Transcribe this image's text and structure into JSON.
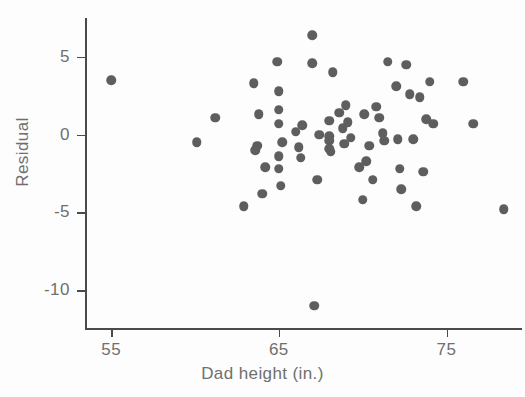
{
  "chart_data": {
    "type": "scatter",
    "title": "",
    "xlabel": "Dad height (in.)",
    "ylabel": "Residual",
    "xlim": [
      53.5,
      79.5
    ],
    "ylim": [
      -12.5,
      7.5
    ],
    "xticks": [
      55,
      65,
      75
    ],
    "xtick_labels": [
      "55",
      "65",
      "75"
    ],
    "yticks": [
      5,
      0,
      -5,
      -10
    ],
    "ytick_labels": [
      "5",
      "0",
      "-5",
      "-10"
    ],
    "grid": false,
    "legend": null,
    "marker": {
      "shape": "circle",
      "color": "#5e5e5e",
      "size": 9.5
    },
    "x": [
      55.0,
      61.2,
      60.1,
      62.9,
      63.6,
      63.7,
      63.8,
      63.5,
      64.0,
      64.2,
      64.9,
      65.0,
      65.0,
      65.0,
      65.0,
      65.0,
      65.1,
      65.2,
      66.0,
      66.2,
      66.3,
      66.4,
      67.0,
      67.0,
      67.1,
      67.3,
      67.4,
      68.0,
      68.0,
      68.0,
      68.0,
      68.1,
      68.2,
      68.6,
      68.8,
      68.9,
      69.0,
      69.1,
      69.3,
      69.8,
      70.0,
      70.1,
      70.2,
      70.4,
      70.6,
      70.8,
      71.0,
      71.2,
      71.3,
      71.5,
      72.0,
      72.1,
      72.2,
      72.3,
      72.6,
      72.8,
      73.0,
      73.2,
      73.4,
      73.6,
      73.8,
      74.0,
      74.2,
      76.0,
      76.6,
      78.4
    ],
    "y": [
      3.5,
      1.1,
      -0.5,
      -4.6,
      -1.0,
      -0.7,
      1.3,
      3.3,
      -3.8,
      -2.1,
      4.7,
      2.8,
      1.6,
      0.7,
      -1.4,
      -2.2,
      -3.3,
      -0.5,
      0.2,
      -0.8,
      -1.5,
      0.6,
      6.4,
      4.6,
      -11.0,
      -2.9,
      0.0,
      0.9,
      -0.1,
      -0.4,
      -0.9,
      -1.1,
      4.0,
      1.4,
      0.4,
      -0.6,
      1.9,
      0.8,
      -0.2,
      -2.1,
      -4.2,
      1.3,
      -1.7,
      -0.7,
      -2.9,
      1.8,
      1.1,
      0.1,
      -0.4,
      4.7,
      3.1,
      -0.3,
      -2.2,
      -3.5,
      4.5,
      2.6,
      -0.3,
      -4.6,
      2.4,
      -2.4,
      1.0,
      3.4,
      0.7,
      3.4,
      0.7,
      -4.8
    ]
  }
}
